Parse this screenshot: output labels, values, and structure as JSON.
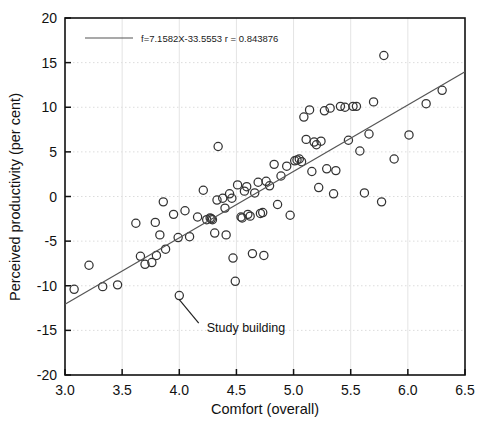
{
  "chart_data": {
    "type": "scatter",
    "title": "",
    "xlabel": "Comfort (overall)",
    "ylabel": "Perceived productivity (per cent)",
    "xlim": [
      3.0,
      6.5
    ],
    "ylim": [
      -20,
      20
    ],
    "xticks": [
      "3.0",
      "3.5",
      "4.0",
      "4.5",
      "5.0",
      "5.5",
      "6.0",
      "6.5"
    ],
    "yticks": [
      "20",
      "15",
      "10",
      "5",
      "0",
      "-5",
      "-10",
      "-15",
      "-20"
    ],
    "xtick_values": [
      3.0,
      3.5,
      4.0,
      4.5,
      5.0,
      5.5,
      6.0,
      6.5
    ],
    "ytick_values": [
      20,
      15,
      10,
      5,
      0,
      -5,
      -10,
      -15,
      -20
    ],
    "grid": true,
    "grid_color": "#dcdcdc",
    "marker": "open-circle",
    "marker_color": "#333333",
    "legend_position": "top-left",
    "legend": [
      {
        "label": "f=7.1582X-33.5553 r = 0.843876",
        "type": "line",
        "color": "#555555"
      }
    ],
    "fit": {
      "equation": "f=7.1582X-33.5553",
      "slope": 7.1582,
      "intercept": -33.5553,
      "r": 0.843876,
      "r_label": "r = 0.843876",
      "x_start": 3.0,
      "x_end": 6.5,
      "y_start": -12.08,
      "y_end": 13.97,
      "color": "#555555"
    },
    "annotations": [
      {
        "text": "Study building",
        "point": [
          4.0,
          -11.1
        ],
        "text_x": 4.24,
        "text_y": -15.2
      }
    ],
    "points": [
      [
        3.08,
        -10.4
      ],
      [
        3.21,
        -7.7
      ],
      [
        3.33,
        -10.1
      ],
      [
        3.46,
        -9.9
      ],
      [
        3.62,
        -3.0
      ],
      [
        3.66,
        -6.7
      ],
      [
        3.7,
        -7.6
      ],
      [
        3.76,
        -7.4
      ],
      [
        3.79,
        -2.9
      ],
      [
        3.8,
        -6.6
      ],
      [
        3.83,
        -4.3
      ],
      [
        3.86,
        -0.6
      ],
      [
        3.88,
        -5.9
      ],
      [
        3.95,
        -2.0
      ],
      [
        3.99,
        -4.6
      ],
      [
        4.0,
        -11.1
      ],
      [
        4.05,
        -1.6
      ],
      [
        4.09,
        -4.5
      ],
      [
        4.16,
        -2.3
      ],
      [
        4.21,
        0.7
      ],
      [
        4.24,
        -2.6
      ],
      [
        4.27,
        -2.4
      ],
      [
        4.28,
        -2.5
      ],
      [
        4.29,
        -2.6
      ],
      [
        4.31,
        -4.1
      ],
      [
        4.33,
        -0.4
      ],
      [
        4.34,
        5.6
      ],
      [
        4.38,
        -0.2
      ],
      [
        4.4,
        -1.3
      ],
      [
        4.41,
        -4.3
      ],
      [
        4.44,
        0.3
      ],
      [
        4.46,
        -0.2
      ],
      [
        4.47,
        -6.9
      ],
      [
        4.49,
        -9.5
      ],
      [
        4.51,
        1.3
      ],
      [
        4.54,
        -2.3
      ],
      [
        4.55,
        -2.4
      ],
      [
        4.57,
        0.6
      ],
      [
        4.59,
        1.1
      ],
      [
        4.6,
        -2.0
      ],
      [
        4.62,
        -2.2
      ],
      [
        4.64,
        -6.4
      ],
      [
        4.66,
        0.4
      ],
      [
        4.69,
        1.6
      ],
      [
        4.71,
        -1.9
      ],
      [
        4.73,
        -1.8
      ],
      [
        4.74,
        -6.6
      ],
      [
        4.76,
        1.7
      ],
      [
        4.79,
        1.2
      ],
      [
        4.83,
        3.6
      ],
      [
        4.86,
        -0.9
      ],
      [
        4.89,
        2.3
      ],
      [
        4.94,
        3.4
      ],
      [
        4.97,
        -2.1
      ],
      [
        5.01,
        4.0
      ],
      [
        5.03,
        4.1
      ],
      [
        5.05,
        4.2
      ],
      [
        5.07,
        3.9
      ],
      [
        5.09,
        8.9
      ],
      [
        5.11,
        6.4
      ],
      [
        5.14,
        9.7
      ],
      [
        5.16,
        2.8
      ],
      [
        5.18,
        6.1
      ],
      [
        5.2,
        5.8
      ],
      [
        5.22,
        1.0
      ],
      [
        5.24,
        6.2
      ],
      [
        5.27,
        9.6
      ],
      [
        5.29,
        3.1
      ],
      [
        5.32,
        9.9
      ],
      [
        5.35,
        0.3
      ],
      [
        5.37,
        2.9
      ],
      [
        5.41,
        10.1
      ],
      [
        5.45,
        10.0
      ],
      [
        5.48,
        6.3
      ],
      [
        5.52,
        10.1
      ],
      [
        5.55,
        10.1
      ],
      [
        5.58,
        5.1
      ],
      [
        5.62,
        0.4
      ],
      [
        5.66,
        7.0
      ],
      [
        5.7,
        10.6
      ],
      [
        5.77,
        -0.6
      ],
      [
        5.79,
        15.8
      ],
      [
        5.88,
        4.2
      ],
      [
        6.01,
        6.9
      ],
      [
        6.16,
        10.4
      ],
      [
        6.3,
        11.9
      ]
    ]
  }
}
